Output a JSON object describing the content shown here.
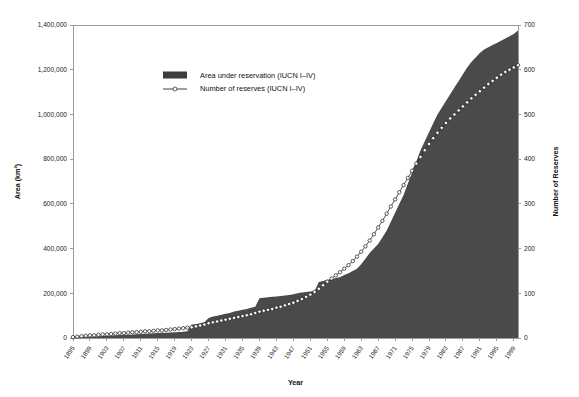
{
  "chart_data": {
    "type": "area",
    "title": "",
    "xlabel": "Year",
    "ylabel": "Area (km²)",
    "y2label": "Number of Reserves",
    "xlim": [
      1895,
      2000
    ],
    "ylim": [
      0,
      1400000
    ],
    "y2lim": [
      0,
      700
    ],
    "grid": false,
    "legend_position": "top-left-inside",
    "y_ticks": [
      "0",
      "200,000",
      "400,000",
      "600,000",
      "800,000",
      "1,000,000",
      "1,200,000",
      "1,400,000"
    ],
    "y_tick_values": [
      0,
      200000,
      400000,
      600000,
      800000,
      1000000,
      1200000,
      1400000
    ],
    "y2_ticks": [
      "0",
      "100",
      "200",
      "300",
      "400",
      "500",
      "600",
      "700"
    ],
    "y2_tick_values": [
      0,
      100,
      200,
      300,
      400,
      500,
      600,
      700
    ],
    "x_ticks": [
      "1895",
      "1899",
      "1903",
      "1907",
      "1911",
      "1915",
      "1919",
      "1923",
      "1927",
      "1931",
      "1935",
      "1939",
      "1943",
      "1947",
      "1951",
      "1955",
      "1959",
      "1963",
      "1967",
      "1971",
      "1975",
      "1979",
      "1983",
      "1987",
      "1991",
      "1995",
      "1999"
    ],
    "series": [
      {
        "name": "Area under reservation (IUCN I–IV)",
        "type": "area",
        "color": "#4a4a4a",
        "axis": "left",
        "x": [
          1895,
          1896,
          1897,
          1898,
          1899,
          1900,
          1901,
          1902,
          1903,
          1904,
          1905,
          1906,
          1907,
          1908,
          1909,
          1910,
          1911,
          1912,
          1913,
          1914,
          1915,
          1916,
          1917,
          1918,
          1919,
          1920,
          1921,
          1922,
          1923,
          1924,
          1925,
          1926,
          1927,
          1928,
          1929,
          1930,
          1931,
          1932,
          1933,
          1934,
          1935,
          1936,
          1937,
          1938,
          1939,
          1940,
          1941,
          1942,
          1943,
          1944,
          1945,
          1946,
          1947,
          1948,
          1949,
          1950,
          1951,
          1952,
          1953,
          1954,
          1955,
          1956,
          1957,
          1958,
          1959,
          1960,
          1961,
          1962,
          1963,
          1964,
          1965,
          1966,
          1967,
          1968,
          1969,
          1970,
          1971,
          1972,
          1973,
          1974,
          1975,
          1976,
          1977,
          1978,
          1979,
          1980,
          1981,
          1982,
          1983,
          1984,
          1985,
          1986,
          1987,
          1988,
          1989,
          1990,
          1991,
          1992,
          1993,
          1994,
          1995,
          1996,
          1997,
          1998,
          1999,
          2000
        ],
        "values": [
          2000,
          3000,
          4000,
          5000,
          6000,
          7000,
          8000,
          9000,
          10000,
          11000,
          12000,
          13000,
          14000,
          15000,
          16000,
          17000,
          18000,
          19000,
          20000,
          21000,
          22000,
          23000,
          24000,
          25000,
          26000,
          27000,
          28000,
          30000,
          60000,
          62000,
          66000,
          70000,
          90000,
          96000,
          100000,
          104000,
          108000,
          112000,
          118000,
          122000,
          126000,
          130000,
          135000,
          140000,
          178000,
          180000,
          182000,
          184000,
          186000,
          188000,
          190000,
          192000,
          196000,
          200000,
          204000,
          206000,
          208000,
          210000,
          250000,
          255000,
          260000,
          262000,
          268000,
          272000,
          282000,
          290000,
          300000,
          310000,
          330000,
          355000,
          380000,
          400000,
          420000,
          450000,
          480000,
          520000,
          560000,
          600000,
          640000,
          690000,
          740000,
          790000,
          840000,
          880000,
          920000,
          960000,
          1000000,
          1030000,
          1060000,
          1090000,
          1120000,
          1150000,
          1180000,
          1210000,
          1235000,
          1255000,
          1275000,
          1290000,
          1300000,
          1310000,
          1320000,
          1330000,
          1340000,
          1350000,
          1360000,
          1375000
        ]
      },
      {
        "name": "Number of reserves (IUCN I–IV)",
        "type": "line",
        "color": "#2a2a2a",
        "marker": "open-circle",
        "axis": "right",
        "x": [
          1895,
          1896,
          1897,
          1898,
          1899,
          1900,
          1901,
          1902,
          1903,
          1904,
          1905,
          1906,
          1907,
          1908,
          1909,
          1910,
          1911,
          1912,
          1913,
          1914,
          1915,
          1916,
          1917,
          1918,
          1919,
          1920,
          1921,
          1922,
          1923,
          1924,
          1925,
          1926,
          1927,
          1928,
          1929,
          1930,
          1931,
          1932,
          1933,
          1934,
          1935,
          1936,
          1937,
          1938,
          1939,
          1940,
          1941,
          1942,
          1943,
          1944,
          1945,
          1946,
          1947,
          1948,
          1949,
          1950,
          1951,
          1952,
          1953,
          1954,
          1955,
          1956,
          1957,
          1958,
          1959,
          1960,
          1961,
          1962,
          1963,
          1964,
          1965,
          1966,
          1967,
          1968,
          1969,
          1970,
          1971,
          1972,
          1973,
          1974,
          1975,
          1976,
          1977,
          1978,
          1979,
          1980,
          1981,
          1982,
          1983,
          1984,
          1985,
          1986,
          1987,
          1988,
          1989,
          1990,
          1991,
          1992,
          1993,
          1994,
          1995,
          1996,
          1997,
          1998,
          1999,
          2000
        ],
        "values": [
          2,
          3,
          4,
          5,
          6,
          6,
          7,
          8,
          8,
          9,
          10,
          11,
          11,
          12,
          13,
          13,
          14,
          15,
          15,
          16,
          17,
          17,
          18,
          19,
          20,
          21,
          22,
          23,
          24,
          26,
          28,
          30,
          33,
          35,
          37,
          39,
          41,
          43,
          45,
          47,
          49,
          51,
          53,
          56,
          59,
          61,
          63,
          65,
          68,
          70,
          73,
          76,
          79,
          83,
          87,
          92,
          97,
          103,
          110,
          118,
          126,
          133,
          140,
          147,
          155,
          163,
          172,
          182,
          193,
          205,
          218,
          232,
          247,
          262,
          278,
          294,
          310,
          326,
          342,
          358,
          374,
          390,
          405,
          420,
          434,
          447,
          459,
          470,
          481,
          491,
          500,
          509,
          518,
          527,
          536,
          544,
          552,
          560,
          568,
          575,
          582,
          589,
          595,
          600,
          605,
          610
        ]
      }
    ]
  },
  "legend": {
    "items": [
      {
        "label": "Area under reservation (IUCN I–IV)",
        "swatch": "area-swatch"
      },
      {
        "label": "Number of reserves (IUCN I–IV)",
        "swatch": "line-marker-swatch"
      }
    ]
  },
  "colors": {
    "area": "#4a4a4a",
    "line": "#2a2a2a",
    "marker_fill": "#ffffff",
    "axis": "#9a9a9a",
    "text": "#1a1a1a",
    "background": "#ffffff"
  }
}
